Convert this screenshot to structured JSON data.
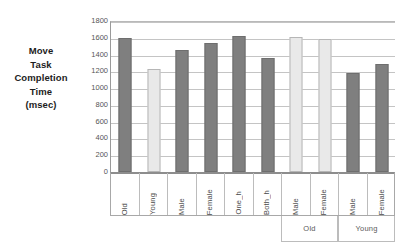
{
  "chart_data": {
    "type": "bar",
    "title": "",
    "xlabel": "",
    "ylabel": "Move Task Completion Time (msec)",
    "ylabel_lines": [
      "Move",
      "Task",
      "Completion",
      "Time",
      "(msec)"
    ],
    "ylim": [
      0,
      1800
    ],
    "ytick_step": 200,
    "yticks": [
      1800,
      1600,
      1400,
      1200,
      1000,
      800,
      600,
      400,
      200,
      0
    ],
    "ytick_labels": [
      "1800",
      "1600",
      "1400",
      "1200",
      "1000",
      "800",
      "600",
      "400",
      "200",
      "0"
    ],
    "grid": true,
    "legend": "none",
    "categories": [
      "Old",
      "Young",
      "Male",
      "Female",
      "One_h",
      "Both_h",
      "Male",
      "Female",
      "Male",
      "Female"
    ],
    "values": [
      1600,
      1230,
      1450,
      1540,
      1620,
      1365,
      1615,
      1580,
      1180,
      1285
    ],
    "bar_styles": [
      "dark",
      "light",
      "dark",
      "dark",
      "dark",
      "dark",
      "light",
      "light",
      "dark",
      "dark"
    ],
    "group_band": [
      {
        "label": "",
        "start_index": 0,
        "span": 6,
        "bordered": false
      },
      {
        "label": "Old",
        "start_index": 6,
        "span": 2,
        "bordered": true
      },
      {
        "label": "Young",
        "start_index": 8,
        "span": 2,
        "bordered": true
      }
    ]
  },
  "colors": {
    "bar_dark": "#7f7f7f",
    "bar_dark_border": "#6e6e6e",
    "bar_light": "#e9e9e9",
    "bar_light_border": "#b6b6b6",
    "gridline": "#c4c4c4",
    "axis": "#8d8d8d",
    "text": "#4a4a4a",
    "title_text": "#1d1d1d",
    "background": "#ffffff"
  }
}
